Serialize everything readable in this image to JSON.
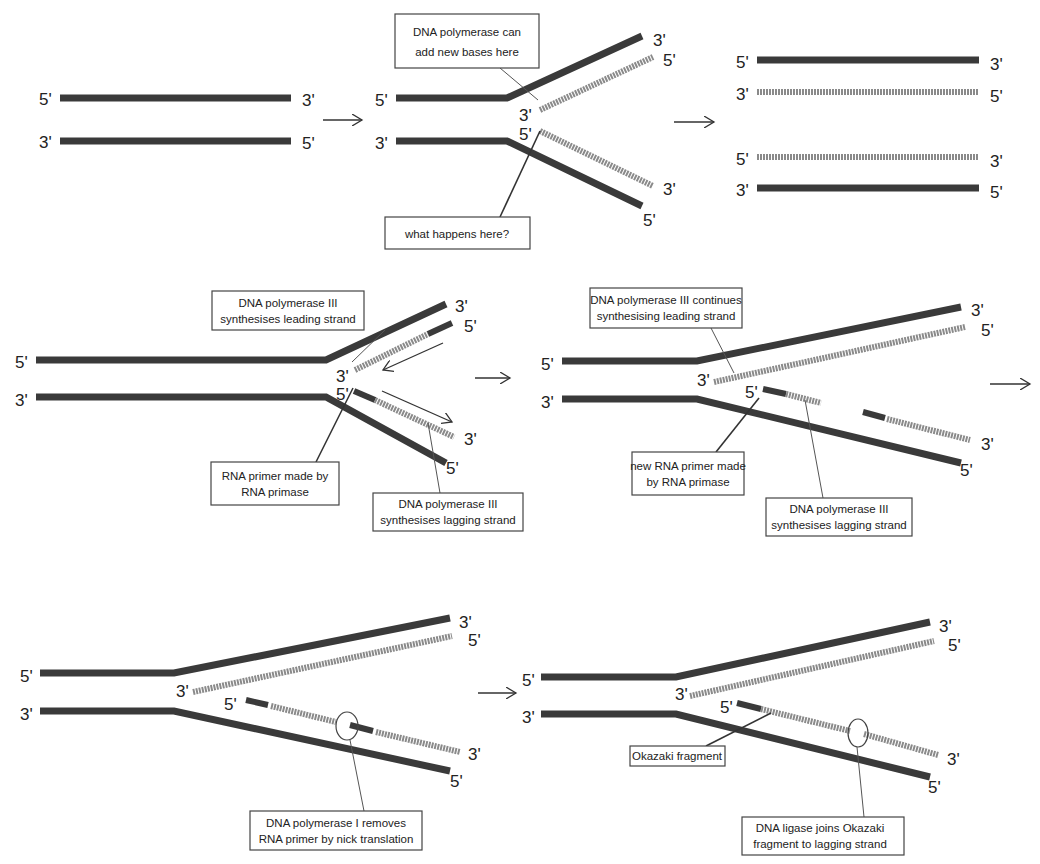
{
  "colors": {
    "parent_strand": "#3a3a3a",
    "new_strand": "#8a8a8a",
    "background": "#ffffff",
    "text": "#222222"
  },
  "end_labels": {
    "five_prime": "5'",
    "three_prime": "3'"
  },
  "panels": [
    {
      "id": "p1",
      "description": "Parent double-stranded DNA",
      "labels": []
    },
    {
      "id": "p2",
      "description": "Replication fork opens",
      "labels": [
        {
          "lines": [
            "DNA polymerase can",
            "add new bases here"
          ]
        },
        {
          "lines": [
            "what happens here?"
          ]
        }
      ]
    },
    {
      "id": "p3",
      "description": "Two daughter DNA molecules",
      "labels": []
    },
    {
      "id": "p4",
      "description": "Leading and lagging strand synthesis begins",
      "labels": [
        {
          "lines": [
            "DNA polymerase III",
            "synthesises leading strand"
          ]
        },
        {
          "lines": [
            "RNA primer made by",
            "RNA primase"
          ]
        },
        {
          "lines": [
            "DNA polymerase III",
            "synthesises lagging strand"
          ]
        }
      ]
    },
    {
      "id": "p5",
      "description": "Continued synthesis with new primer",
      "labels": [
        {
          "lines": [
            "DNA polymerase III continues",
            "synthesising leading strand"
          ]
        },
        {
          "lines": [
            "new RNA primer made",
            "by RNA primase"
          ]
        },
        {
          "lines": [
            "DNA polymerase III",
            "synthesises lagging strand"
          ]
        }
      ]
    },
    {
      "id": "p6",
      "description": "Primer removal",
      "labels": [
        {
          "lines": [
            "DNA polymerase I removes",
            "RNA primer by nick translation"
          ]
        }
      ]
    },
    {
      "id": "p7",
      "description": "Ligation of Okazaki fragment",
      "labels": [
        {
          "lines": [
            "Okazaki fragment"
          ]
        },
        {
          "lines": [
            "DNA ligase joins Okazaki",
            "fragment to lagging strand"
          ]
        }
      ]
    }
  ]
}
